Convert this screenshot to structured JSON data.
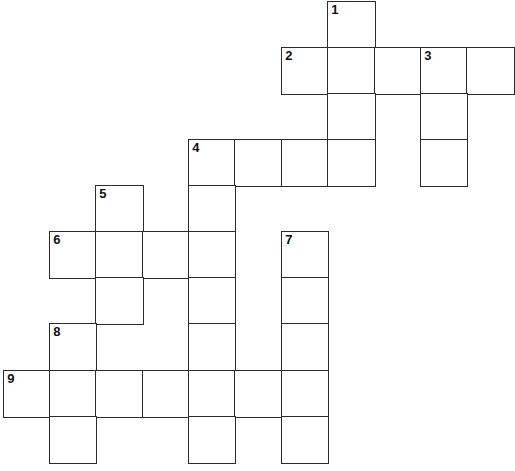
{
  "puzzle": {
    "type": "crossword",
    "colors": {
      "line": "#2b2b2b",
      "background": "#ffffff",
      "number": "#111111"
    },
    "col_edges": [
      4,
      50,
      96,
      143,
      189,
      235,
      282,
      328,
      375,
      421,
      467,
      514
    ],
    "row_edges": [
      2,
      48,
      94,
      140,
      186,
      232,
      278,
      324,
      371,
      417,
      463
    ],
    "cells": [
      {
        "r": 0,
        "c": 7,
        "num": "1"
      },
      {
        "r": 1,
        "c": 6,
        "num": "2"
      },
      {
        "r": 1,
        "c": 7,
        "num": ""
      },
      {
        "r": 1,
        "c": 8,
        "num": ""
      },
      {
        "r": 1,
        "c": 9,
        "num": "3"
      },
      {
        "r": 1,
        "c": 10,
        "num": ""
      },
      {
        "r": 2,
        "c": 7,
        "num": ""
      },
      {
        "r": 2,
        "c": 9,
        "num": ""
      },
      {
        "r": 3,
        "c": 4,
        "num": "4"
      },
      {
        "r": 3,
        "c": 5,
        "num": ""
      },
      {
        "r": 3,
        "c": 6,
        "num": ""
      },
      {
        "r": 3,
        "c": 7,
        "num": ""
      },
      {
        "r": 3,
        "c": 9,
        "num": ""
      },
      {
        "r": 4,
        "c": 2,
        "num": "5"
      },
      {
        "r": 4,
        "c": 4,
        "num": ""
      },
      {
        "r": 5,
        "c": 1,
        "num": "6"
      },
      {
        "r": 5,
        "c": 2,
        "num": ""
      },
      {
        "r": 5,
        "c": 3,
        "num": ""
      },
      {
        "r": 5,
        "c": 4,
        "num": ""
      },
      {
        "r": 5,
        "c": 6,
        "num": "7"
      },
      {
        "r": 6,
        "c": 2,
        "num": ""
      },
      {
        "r": 6,
        "c": 4,
        "num": ""
      },
      {
        "r": 6,
        "c": 6,
        "num": ""
      },
      {
        "r": 7,
        "c": 1,
        "num": "8"
      },
      {
        "r": 7,
        "c": 4,
        "num": ""
      },
      {
        "r": 7,
        "c": 6,
        "num": ""
      },
      {
        "r": 8,
        "c": 0,
        "num": "9"
      },
      {
        "r": 8,
        "c": 1,
        "num": ""
      },
      {
        "r": 8,
        "c": 2,
        "num": ""
      },
      {
        "r": 8,
        "c": 3,
        "num": ""
      },
      {
        "r": 8,
        "c": 4,
        "num": ""
      },
      {
        "r": 8,
        "c": 5,
        "num": ""
      },
      {
        "r": 8,
        "c": 6,
        "num": ""
      },
      {
        "r": 9,
        "c": 1,
        "num": ""
      },
      {
        "r": 9,
        "c": 4,
        "num": ""
      },
      {
        "r": 9,
        "c": 6,
        "num": ""
      }
    ],
    "entries": {
      "across": [
        {
          "num": "2",
          "length": 5
        },
        {
          "num": "4",
          "length": 4
        },
        {
          "num": "6",
          "length": 4
        },
        {
          "num": "9",
          "length": 7
        }
      ],
      "down": [
        {
          "num": "1",
          "length": 4
        },
        {
          "num": "3",
          "length": 3
        },
        {
          "num": "4",
          "length": 7
        },
        {
          "num": "5",
          "length": 3
        },
        {
          "num": "7",
          "length": 5
        },
        {
          "num": "8",
          "length": 3
        }
      ]
    }
  }
}
